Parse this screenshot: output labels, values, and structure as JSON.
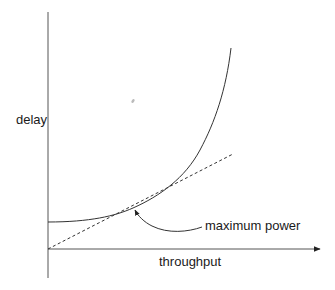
{
  "diagram": {
    "axes": {
      "x_label": "throughput",
      "y_label": "delay"
    },
    "curves": [
      {
        "name": "delay-curve",
        "style": "solid",
        "shape": "convex, rising steeply"
      },
      {
        "name": "tangent-line",
        "style": "dashed",
        "from": "origin"
      }
    ],
    "annotation": {
      "label": "maximum power",
      "points_to": "tangent point of dashed line and delay curve"
    },
    "colors": {
      "line": "#333333",
      "axis": "#555555",
      "text": "#1a1a1a",
      "background": "#ffffff"
    }
  }
}
